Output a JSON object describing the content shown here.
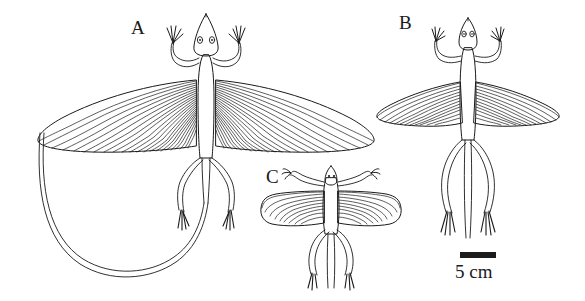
{
  "figure": {
    "type": "scientific-line-drawing",
    "background_color": "#ffffff",
    "ink_color": "#1a1a1a",
    "panels": [
      {
        "id": "A",
        "label": "A",
        "description": "largest specimen, dorsal view, wings fully extended, long tail curving in a large U-loop to the lower left",
        "wing_ribs_per_side": 22,
        "tail": "long, curved U-loop"
      },
      {
        "id": "B",
        "label": "B",
        "description": "medium specimen, dorsal view, wings extended, straight tail pointing downward between hind legs",
        "wing_ribs_per_side": 12,
        "tail": "straight"
      },
      {
        "id": "C",
        "label": "C",
        "description": "smallest specimen, dorsal view, broad wings, short straight tail",
        "wing_ribs_per_side": 9,
        "tail": "straight, short"
      }
    ]
  },
  "scale_bar": {
    "label": "5 cm",
    "value": 5,
    "unit": "cm",
    "color": "#1c1c1c"
  }
}
